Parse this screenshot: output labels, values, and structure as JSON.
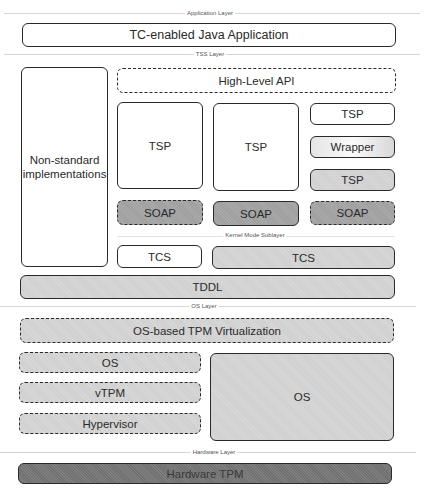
{
  "diagram": {
    "layers": [
      {
        "id": "application",
        "label": "Application Layer"
      },
      {
        "id": "tss",
        "label": "TSS Layer"
      },
      {
        "id": "kernel",
        "label": "Kernel Mode Sublayer"
      },
      {
        "id": "os",
        "label": "OS Layer"
      },
      {
        "id": "hardware",
        "label": "Hardware Layer"
      }
    ],
    "application": {
      "java_app": "TC-enabled Java Application"
    },
    "tss": {
      "non_standard": "Non-standard implementations",
      "high_level_api": "High-Level API",
      "column1": {
        "tsp": "TSP",
        "soap": "SOAP",
        "tcs": "TCS"
      },
      "column2": {
        "tsp": "TSP",
        "soap": "SOAP"
      },
      "column3": {
        "tsp": "TSP",
        "wrapper": "Wrapper",
        "tsp_gray": "TSP",
        "soap": "SOAP"
      },
      "tcs_wide": "TCS",
      "tddl": "TDDL"
    },
    "os": {
      "virtualization": "OS-based TPM Virtualization",
      "guest_os": "OS",
      "vtpm": "vTPM",
      "hypervisor": "Hypervisor",
      "native_os": "OS"
    },
    "hardware": {
      "tpm": "Hardware TPM"
    },
    "colors": {
      "white": "#ffffff",
      "light_gray": "#cfcfcf",
      "mid_gray": "#9e9e9e",
      "dark_gray": "#707070",
      "border": "#2a2a2a"
    }
  }
}
